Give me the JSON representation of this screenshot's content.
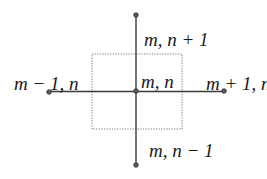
{
  "diagram": {
    "type": "stencil",
    "colors": {
      "line": "#3a3a3a",
      "node_fill": "#5a5a5a",
      "box": "#777777",
      "text": "#1a1a1a",
      "background": "#ffffff"
    },
    "nodes": {
      "center": {
        "x": 136,
        "y": 91,
        "label": "m, n"
      },
      "north": {
        "x": 136,
        "y": 15,
        "label": "m, n + 1"
      },
      "south": {
        "x": 136,
        "y": 165,
        "label": "m, n − 1"
      },
      "west": {
        "x": 49,
        "y": 92,
        "label": "m − 1, n"
      },
      "east": {
        "x": 224,
        "y": 91,
        "label": "m + 1, n"
      }
    },
    "control_volume": {
      "x": 92,
      "y": 54,
      "width": 90,
      "height": 75,
      "style": "dotted"
    }
  }
}
